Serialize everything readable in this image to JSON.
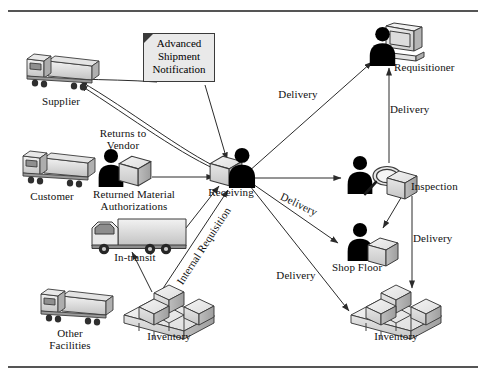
{
  "figure": {
    "frame": {
      "top_rule": true,
      "bottom_rule": true,
      "rule_color": "#555555"
    }
  },
  "nodes": [
    {
      "id": "supplier",
      "label": "Supplier",
      "icon": "semi-truck-icon"
    },
    {
      "id": "customer",
      "label": "Customer",
      "icon": "semi-truck-icon"
    },
    {
      "id": "other",
      "label": "Other\nFacilities",
      "icon": "semi-truck-icon"
    },
    {
      "id": "rma",
      "label": "Returned Material\nAuthorizations",
      "icon": "person-with-box-icon"
    },
    {
      "id": "intransit",
      "label": "In-transit",
      "icon": "box-truck-icon"
    },
    {
      "id": "inventory-left",
      "label": "Inventory",
      "icon": "cube-stack-icon"
    },
    {
      "id": "receiving",
      "label": "Receiving",
      "icon": "person-with-box-icon"
    },
    {
      "id": "requisitioner",
      "label": "Requisitioner",
      "icon": "person-with-computer-icon"
    },
    {
      "id": "inspection",
      "label": "Inspection",
      "icon": "person-with-magnifier-icon"
    },
    {
      "id": "shopfloor",
      "label": "Shop Floor",
      "icon": "person-with-box-icon"
    },
    {
      "id": "inventory-right",
      "label": "Inventory",
      "icon": "cube-stack-icon"
    }
  ],
  "note": {
    "id": "asn",
    "text": "Advanced\nShipment\nNotification",
    "fill": "#e9e9e9",
    "border": "#3a3a3a"
  },
  "edge_labels": [
    {
      "id": "returns-to-vendor",
      "text": "Returns to\nVendor",
      "orientation": "horizontal"
    },
    {
      "id": "internal-requisition",
      "text": "Internal Requisition",
      "orientation": "rotated"
    },
    {
      "id": "delivery-requisitioner",
      "text": "Delivery",
      "orientation": "horizontal"
    },
    {
      "id": "delivery-inspection-requisitioner",
      "text": "Delivery",
      "orientation": "horizontal"
    },
    {
      "id": "delivery-shopfloor",
      "text": "Delivery",
      "orientation": "rotated"
    },
    {
      "id": "delivery-inventory",
      "text": "Delivery",
      "orientation": "horizontal"
    },
    {
      "id": "delivery-inspection-inventory",
      "text": "Delivery",
      "orientation": "horizontal"
    }
  ],
  "edges": [
    {
      "from": "receiving",
      "to": "supplier",
      "label": ""
    },
    {
      "from": "asn",
      "to": "supplier",
      "label": ""
    },
    {
      "from": "asn",
      "to": "receiving",
      "label": ""
    },
    {
      "from": "rma",
      "to": "receiving",
      "label": "Returns to Vendor"
    },
    {
      "from": "intransit",
      "to": "receiving",
      "label": ""
    },
    {
      "from": "inventory-left",
      "to": "intransit",
      "label": ""
    },
    {
      "from": "inventory-left",
      "to": "receiving",
      "label": "Internal Requisition"
    },
    {
      "from": "receiving",
      "to": "requisitioner",
      "label": "Delivery"
    },
    {
      "from": "receiving",
      "to": "inspection",
      "label": ""
    },
    {
      "from": "receiving",
      "to": "shopfloor",
      "label": "Delivery"
    },
    {
      "from": "receiving",
      "to": "inventory-right",
      "label": "Delivery"
    },
    {
      "from": "inspection",
      "to": "requisitioner",
      "label": "Delivery"
    },
    {
      "from": "inspection",
      "to": "shopfloor",
      "label": ""
    },
    {
      "from": "inspection",
      "to": "inventory-right",
      "label": "Delivery"
    }
  ],
  "colors": {
    "line": "#2b2b2b",
    "figure_fill": "#000000",
    "box_light": "#ededed",
    "box_mid": "#cfcfcf",
    "box_dark": "#a8a8a8",
    "outline": "#3a3a3a"
  }
}
